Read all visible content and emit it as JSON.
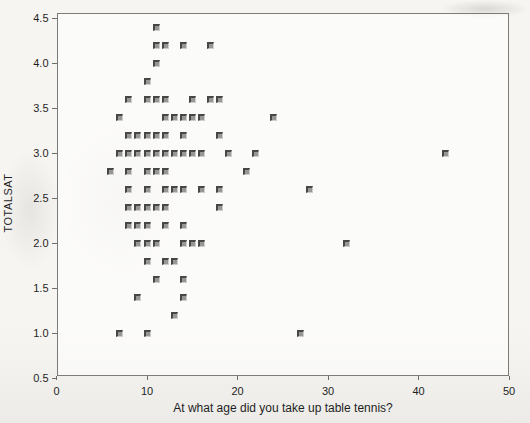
{
  "figure": {
    "x_tick_labels": [
      "0",
      "10",
      "20",
      "30",
      "40",
      "50"
    ],
    "y_tick_labels": [
      "4.5",
      "4.0",
      "3.5",
      "3.0",
      "2.5",
      "2.0",
      "1.5",
      "1.0",
      "0.5"
    ]
  },
  "chart_data": {
    "type": "scatter",
    "title": "",
    "xlabel": "At what age did you take up table tennis?",
    "ylabel": "TOTALSAT",
    "xlim": [
      0,
      50
    ],
    "ylim": [
      0.5,
      4.5
    ],
    "x_ticks": [
      0,
      10,
      20,
      30,
      40,
      50
    ],
    "y_ticks": [
      0.5,
      1.0,
      1.5,
      2.0,
      2.5,
      3.0,
      3.5,
      4.0,
      4.5
    ],
    "grid": false,
    "legend": false,
    "marker": "square",
    "marker_color": "#979797",
    "frame_color": "#7d7b78",
    "points": [
      [
        11,
        4.4
      ],
      [
        11,
        4.2
      ],
      [
        12,
        4.2
      ],
      [
        14,
        4.2
      ],
      [
        17,
        4.2
      ],
      [
        11,
        4.0
      ],
      [
        10,
        3.8
      ],
      [
        8,
        3.6
      ],
      [
        10,
        3.6
      ],
      [
        11,
        3.6
      ],
      [
        12,
        3.6
      ],
      [
        15,
        3.6
      ],
      [
        17,
        3.6
      ],
      [
        18,
        3.6
      ],
      [
        7,
        3.4
      ],
      [
        12,
        3.4
      ],
      [
        13,
        3.4
      ],
      [
        14,
        3.4
      ],
      [
        15,
        3.4
      ],
      [
        16,
        3.4
      ],
      [
        24,
        3.4
      ],
      [
        8,
        3.2
      ],
      [
        9,
        3.2
      ],
      [
        10,
        3.2
      ],
      [
        11,
        3.2
      ],
      [
        12,
        3.2
      ],
      [
        14,
        3.2
      ],
      [
        18,
        3.2
      ],
      [
        7,
        3.0
      ],
      [
        8,
        3.0
      ],
      [
        9,
        3.0
      ],
      [
        10,
        3.0
      ],
      [
        11,
        3.0
      ],
      [
        12,
        3.0
      ],
      [
        13,
        3.0
      ],
      [
        14,
        3.0
      ],
      [
        15,
        3.0
      ],
      [
        16,
        3.0
      ],
      [
        19,
        3.0
      ],
      [
        22,
        3.0
      ],
      [
        43,
        3.0
      ],
      [
        6,
        2.8
      ],
      [
        8,
        2.8
      ],
      [
        10,
        2.8
      ],
      [
        11,
        2.8
      ],
      [
        12,
        2.8
      ],
      [
        21,
        2.8
      ],
      [
        8,
        2.6
      ],
      [
        10,
        2.6
      ],
      [
        12,
        2.6
      ],
      [
        13,
        2.6
      ],
      [
        14,
        2.6
      ],
      [
        16,
        2.6
      ],
      [
        18,
        2.6
      ],
      [
        28,
        2.6
      ],
      [
        8,
        2.4
      ],
      [
        9,
        2.4
      ],
      [
        10,
        2.4
      ],
      [
        11,
        2.4
      ],
      [
        12,
        2.4
      ],
      [
        18,
        2.4
      ],
      [
        8,
        2.2
      ],
      [
        9,
        2.2
      ],
      [
        10,
        2.2
      ],
      [
        12,
        2.2
      ],
      [
        14,
        2.2
      ],
      [
        9,
        2.0
      ],
      [
        10,
        2.0
      ],
      [
        11,
        2.0
      ],
      [
        14,
        2.0
      ],
      [
        15,
        2.0
      ],
      [
        16,
        2.0
      ],
      [
        32,
        2.0
      ],
      [
        10,
        1.8
      ],
      [
        12,
        1.8
      ],
      [
        13,
        1.8
      ],
      [
        11,
        1.6
      ],
      [
        14,
        1.6
      ],
      [
        9,
        1.4
      ],
      [
        14,
        1.4
      ],
      [
        13,
        1.2
      ],
      [
        7,
        1.0
      ],
      [
        10,
        1.0
      ],
      [
        27,
        1.0
      ]
    ]
  }
}
